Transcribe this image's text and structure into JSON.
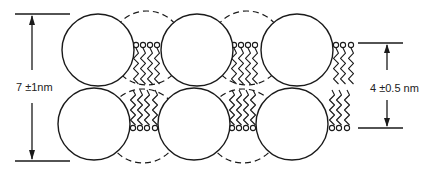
{
  "figure": {
    "type": "membrane cross-section schematic",
    "colors": {
      "stroke": "#1a1a1a",
      "background": "#ffffff"
    }
  },
  "dimensions": {
    "total_thickness": {
      "label": "7 ±1nm",
      "value": 7,
      "tolerance": 1,
      "unit": "nm"
    },
    "bilayer_thickness": {
      "label": "4 ±0.5 nm",
      "value": 4,
      "tolerance": 0.5,
      "unit": "nm"
    }
  },
  "shapes": {
    "solid_circles_top": [
      [
        98,
        50
      ],
      [
        197,
        50
      ],
      [
        297,
        50
      ]
    ],
    "solid_circles_bottom": [
      [
        94,
        124
      ],
      [
        194,
        124
      ],
      [
        292,
        124
      ]
    ],
    "dashed_circles_top": [
      [
        147,
        48
      ],
      [
        247,
        48
      ]
    ],
    "dashed_circles_bottom": [
      [
        143,
        126
      ],
      [
        243,
        126
      ]
    ],
    "radius": 36,
    "lipid_groups": [
      {
        "top_heads_x": [
          136,
          143,
          150,
          157
        ],
        "bottom_heads_x": [
          133,
          140,
          147,
          155
        ]
      },
      {
        "top_heads_x": [
          234,
          241,
          248,
          255
        ],
        "bottom_heads_x": [
          232,
          239,
          246,
          253
        ]
      },
      {
        "top_heads_x": [
          336,
          343,
          351
        ],
        "bottom_heads_x": [
          332,
          339,
          347
        ]
      }
    ],
    "head_top_y": 45,
    "head_bottom_y": 128
  }
}
